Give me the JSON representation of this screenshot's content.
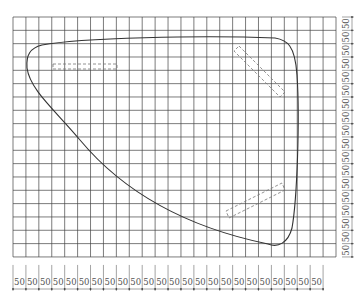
{
  "diagram": {
    "type": "grid-sketch",
    "grid": {
      "left": 13,
      "top": 17,
      "cols": 25,
      "rows": 18,
      "cell_w": 12.92,
      "cell_h": 13.33,
      "line_color": "#444444"
    },
    "dimension_labels": {
      "bottom": {
        "count": 24,
        "value": "50",
        "start_x": 13,
        "step": 12.92,
        "baseline_y": 285
      },
      "right": {
        "count": 18,
        "value": "50",
        "start_y": 17,
        "step": 13.33,
        "x": 346
      }
    },
    "outline": {
      "stroke": "#333333",
      "path": "M 42 45 C 80 38, 200 35, 275 38 C 287 40, 295 45, 297 75 C 300 120, 297 200, 292 228 C 288 243, 278 248, 268 244 C 200 230, 130 200, 80 140 C 55 110, 30 90, 27 68 C 26 55, 30 48, 42 45 Z"
    },
    "dashed_shapes": [
      {
        "name": "dashed-rect-left",
        "points": "53,64 117,64 117,69 53,69"
      },
      {
        "name": "dashed-rect-top-right",
        "points": "239,46 285,92 280,97 234,51"
      },
      {
        "name": "dashed-rect-bottom-right",
        "points": "226,211 282,183 285,190 229,218"
      }
    ],
    "dashed_color": "#777777"
  }
}
